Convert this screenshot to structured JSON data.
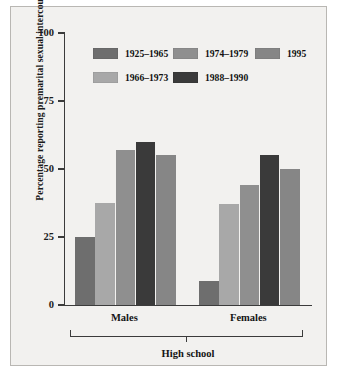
{
  "chart_data": {
    "type": "bar",
    "title": "",
    "subtitle": "",
    "xlabel": "High school",
    "ylabel": "Percentage reporting premarital sexual intercourse",
    "ylim": [
      0,
      100
    ],
    "yticks": [
      0,
      25,
      50,
      75,
      100
    ],
    "grid": false,
    "legend_position": "top-left-inside",
    "categories": [
      "Males",
      "Females"
    ],
    "series": [
      {
        "name": "1925–1965",
        "color": "#6e6e6e",
        "values": [
          25,
          9
        ]
      },
      {
        "name": "1966–1973",
        "color": "#a8a8a8",
        "values": [
          37.5,
          37
        ]
      },
      {
        "name": "1974–1979",
        "color": "#8f8f8f",
        "values": [
          57,
          44
        ]
      },
      {
        "name": "1988–1990",
        "color": "#3a3a3a",
        "values": [
          60,
          55
        ]
      },
      {
        "name": "1995",
        "color": "#868686",
        "values": [
          55,
          50
        ]
      }
    ],
    "annotations": [
      "Males",
      "Females",
      "High school"
    ],
    "colors": {
      "panel_background": "#f2f1ef",
      "panel_border": "#b9b7b3",
      "axis": "#3b3b3b",
      "text": "#141414"
    }
  },
  "axis": {
    "y_title": "Percentage reporting premarital sexual intercourse",
    "y_tick_labels": [
      "100",
      "75",
      "50",
      "25",
      "0"
    ],
    "group_labels": [
      "Males",
      "Females"
    ],
    "outer_group_label": "High school"
  },
  "legend": {
    "row1": [
      {
        "label": "1925–1965"
      },
      {
        "label": "1974–1979"
      },
      {
        "label": "1995"
      }
    ],
    "row2": [
      {
        "label": "1966–1973"
      },
      {
        "label": "1988–1990"
      }
    ]
  }
}
